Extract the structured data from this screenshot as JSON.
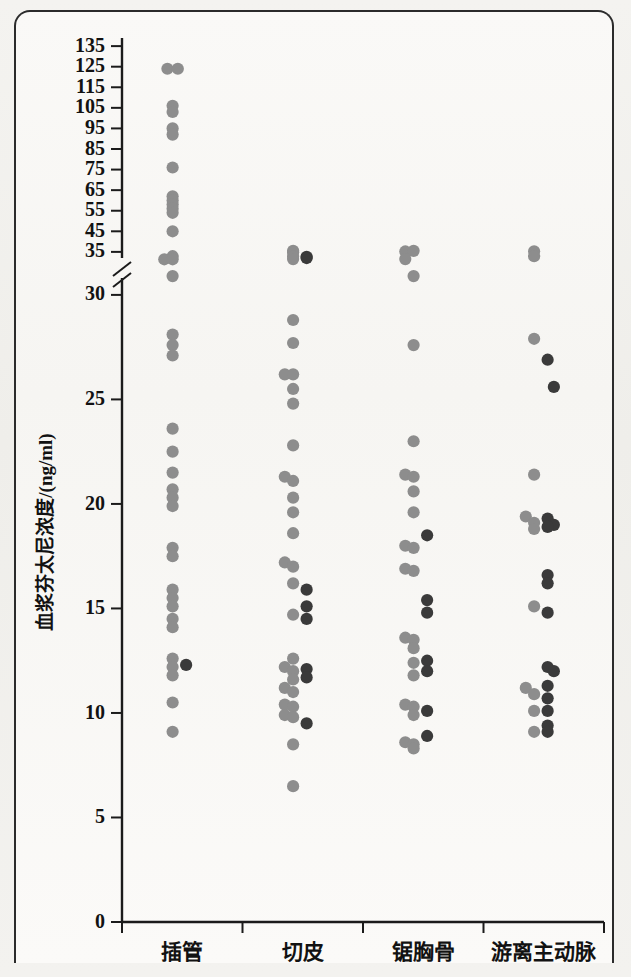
{
  "figure": {
    "background_color": "#f2f1ee",
    "frame_color": "#2b2b2b"
  },
  "chart_data": {
    "type": "scatter",
    "title": "",
    "xlabel": "",
    "ylabel": "血浆芬太尼浓度/(ng/ml)",
    "categories": [
      "插管",
      "切皮",
      "锯胸骨",
      "游离主动脉"
    ],
    "y_axis": {
      "broken": true,
      "lower_ticks": [
        0,
        5,
        10,
        15,
        20,
        25,
        30
      ],
      "upper_ticks": [
        35,
        45,
        55,
        65,
        75,
        85,
        95,
        105,
        115,
        125,
        135
      ],
      "lower_range": [
        0,
        31
      ],
      "upper_range": [
        33,
        137
      ],
      "break_symbol": "//",
      "grid": false
    },
    "legend": {
      "visible": false,
      "position": "none"
    },
    "series": [
      {
        "name": "series-gray",
        "color": "#8d8d8d",
        "points": [
          {
            "category": "插管",
            "y": 124,
            "jitter": -1
          },
          {
            "category": "插管",
            "y": 124,
            "jitter": 1
          },
          {
            "category": "插管",
            "y": 106,
            "jitter": 0
          },
          {
            "category": "插管",
            "y": 103,
            "jitter": 0
          },
          {
            "category": "插管",
            "y": 95,
            "jitter": 0
          },
          {
            "category": "插管",
            "y": 92,
            "jitter": 0
          },
          {
            "category": "插管",
            "y": 76,
            "jitter": 0
          },
          {
            "category": "插管",
            "y": 62,
            "jitter": 0
          },
          {
            "category": "插管",
            "y": 60,
            "jitter": 0
          },
          {
            "category": "插管",
            "y": 58,
            "jitter": 0
          },
          {
            "category": "插管",
            "y": 56,
            "jitter": 0
          },
          {
            "category": "插管",
            "y": 54,
            "jitter": 0
          },
          {
            "category": "插管",
            "y": 45,
            "jitter": 0
          },
          {
            "category": "插管",
            "y": 32.9,
            "jitter": 0
          },
          {
            "category": "插管",
            "y": 31.4,
            "jitter": -1.6
          },
          {
            "category": "插管",
            "y": 31.4,
            "jitter": 0
          },
          {
            "category": "插管",
            "y": 30.9,
            "jitter": 0
          },
          {
            "category": "插管",
            "y": 28.1,
            "jitter": 0
          },
          {
            "category": "插管",
            "y": 27.6,
            "jitter": 0
          },
          {
            "category": "插管",
            "y": 27.1,
            "jitter": 0
          },
          {
            "category": "插管",
            "y": 23.6,
            "jitter": 0
          },
          {
            "category": "插管",
            "y": 22.5,
            "jitter": 0
          },
          {
            "category": "插管",
            "y": 21.5,
            "jitter": 0
          },
          {
            "category": "插管",
            "y": 20.7,
            "jitter": 0
          },
          {
            "category": "插管",
            "y": 20.3,
            "jitter": 0
          },
          {
            "category": "插管",
            "y": 19.9,
            "jitter": 0
          },
          {
            "category": "插管",
            "y": 17.9,
            "jitter": 0
          },
          {
            "category": "插管",
            "y": 17.5,
            "jitter": 0
          },
          {
            "category": "插管",
            "y": 15.9,
            "jitter": 0
          },
          {
            "category": "插管",
            "y": 15.5,
            "jitter": 0
          },
          {
            "category": "插管",
            "y": 15.1,
            "jitter": 0
          },
          {
            "category": "插管",
            "y": 14.5,
            "jitter": 0
          },
          {
            "category": "插管",
            "y": 14.1,
            "jitter": 0
          },
          {
            "category": "插管",
            "y": 12.6,
            "jitter": 0
          },
          {
            "category": "插管",
            "y": 12.2,
            "jitter": 0
          },
          {
            "category": "插管",
            "y": 11.8,
            "jitter": 0
          },
          {
            "category": "插管",
            "y": 10.5,
            "jitter": 0
          },
          {
            "category": "插管",
            "y": 9.1,
            "jitter": 0
          },
          {
            "category": "切皮",
            "y": 35.5,
            "jitter": 0
          },
          {
            "category": "切皮",
            "y": 34.8,
            "jitter": 0
          },
          {
            "category": "切皮",
            "y": 32.8,
            "jitter": 0
          },
          {
            "category": "切皮",
            "y": 31.5,
            "jitter": 0
          },
          {
            "category": "切皮",
            "y": 28.8,
            "jitter": 0
          },
          {
            "category": "切皮",
            "y": 27.7,
            "jitter": 0
          },
          {
            "category": "切皮",
            "y": 26.2,
            "jitter": -1.6
          },
          {
            "category": "切皮",
            "y": 26.2,
            "jitter": 0
          },
          {
            "category": "切皮",
            "y": 25.5,
            "jitter": 0
          },
          {
            "category": "切皮",
            "y": 24.8,
            "jitter": 0
          },
          {
            "category": "切皮",
            "y": 22.8,
            "jitter": 0
          },
          {
            "category": "切皮",
            "y": 21.3,
            "jitter": -1.6
          },
          {
            "category": "切皮",
            "y": 21.1,
            "jitter": 0
          },
          {
            "category": "切皮",
            "y": 20.3,
            "jitter": 0
          },
          {
            "category": "切皮",
            "y": 19.6,
            "jitter": 0
          },
          {
            "category": "切皮",
            "y": 18.6,
            "jitter": 0
          },
          {
            "category": "切皮",
            "y": 17.2,
            "jitter": -1.6
          },
          {
            "category": "切皮",
            "y": 17.0,
            "jitter": 0
          },
          {
            "category": "切皮",
            "y": 16.2,
            "jitter": 0
          },
          {
            "category": "切皮",
            "y": 14.7,
            "jitter": 0
          },
          {
            "category": "切皮",
            "y": 12.6,
            "jitter": 0
          },
          {
            "category": "切皮",
            "y": 12.2,
            "jitter": -1.6
          },
          {
            "category": "切皮",
            "y": 12.0,
            "jitter": 0
          },
          {
            "category": "切皮",
            "y": 11.6,
            "jitter": 0
          },
          {
            "category": "切皮",
            "y": 11.2,
            "jitter": -1.6
          },
          {
            "category": "切皮",
            "y": 11.0,
            "jitter": 0
          },
          {
            "category": "切皮",
            "y": 10.4,
            "jitter": -1.6
          },
          {
            "category": "切皮",
            "y": 10.3,
            "jitter": 0
          },
          {
            "category": "切皮",
            "y": 9.9,
            "jitter": -1.6
          },
          {
            "category": "切皮",
            "y": 9.8,
            "jitter": 0
          },
          {
            "category": "切皮",
            "y": 8.5,
            "jitter": 0
          },
          {
            "category": "切皮",
            "y": 6.5,
            "jitter": 0
          },
          {
            "category": "锯胸骨",
            "y": 35.2,
            "jitter": -1.6
          },
          {
            "category": "锯胸骨",
            "y": 35.5,
            "jitter": 0
          },
          {
            "category": "锯胸骨",
            "y": 31.5,
            "jitter": -1.6
          },
          {
            "category": "锯胸骨",
            "y": 30.9,
            "jitter": 0
          },
          {
            "category": "锯胸骨",
            "y": 27.6,
            "jitter": 0
          },
          {
            "category": "锯胸骨",
            "y": 23.0,
            "jitter": 0
          },
          {
            "category": "锯胸骨",
            "y": 21.4,
            "jitter": -1.6
          },
          {
            "category": "锯胸骨",
            "y": 21.3,
            "jitter": 0
          },
          {
            "category": "锯胸骨",
            "y": 20.6,
            "jitter": 0
          },
          {
            "category": "锯胸骨",
            "y": 19.6,
            "jitter": 0
          },
          {
            "category": "锯胸骨",
            "y": 18.0,
            "jitter": -1.6
          },
          {
            "category": "锯胸骨",
            "y": 17.9,
            "jitter": 0
          },
          {
            "category": "锯胸骨",
            "y": 16.9,
            "jitter": -1.6
          },
          {
            "category": "锯胸骨",
            "y": 16.8,
            "jitter": 0
          },
          {
            "category": "锯胸骨",
            "y": 13.6,
            "jitter": -1.6
          },
          {
            "category": "锯胸骨",
            "y": 13.5,
            "jitter": 0
          },
          {
            "category": "锯胸骨",
            "y": 13.1,
            "jitter": 0
          },
          {
            "category": "锯胸骨",
            "y": 12.4,
            "jitter": 0
          },
          {
            "category": "锯胸骨",
            "y": 11.8,
            "jitter": 0
          },
          {
            "category": "锯胸骨",
            "y": 10.4,
            "jitter": -1.6
          },
          {
            "category": "锯胸骨",
            "y": 10.3,
            "jitter": 0
          },
          {
            "category": "锯胸骨",
            "y": 9.9,
            "jitter": 0
          },
          {
            "category": "锯胸骨",
            "y": 8.6,
            "jitter": -1.6
          },
          {
            "category": "锯胸骨",
            "y": 8.5,
            "jitter": 0
          },
          {
            "category": "锯胸骨",
            "y": 8.3,
            "jitter": 0
          },
          {
            "category": "游离主动脉",
            "y": 35.3,
            "jitter": 0
          },
          {
            "category": "游离主动脉",
            "y": 32.9,
            "jitter": 0
          },
          {
            "category": "游离主动脉",
            "y": 27.9,
            "jitter": 0
          },
          {
            "category": "游离主动脉",
            "y": 21.4,
            "jitter": 0
          },
          {
            "category": "游离主动脉",
            "y": 19.4,
            "jitter": -1.6
          },
          {
            "category": "游离主动脉",
            "y": 19.1,
            "jitter": 0
          },
          {
            "category": "游离主动脉",
            "y": 18.8,
            "jitter": 0
          },
          {
            "category": "游离主动脉",
            "y": 15.1,
            "jitter": 0
          },
          {
            "category": "游离主动脉",
            "y": 11.2,
            "jitter": -1.6
          },
          {
            "category": "游离主动脉",
            "y": 10.9,
            "jitter": 0
          },
          {
            "category": "游离主动脉",
            "y": 10.1,
            "jitter": 0
          },
          {
            "category": "游离主动脉",
            "y": 9.1,
            "jitter": 0
          }
        ]
      },
      {
        "name": "series-dark",
        "color": "#3a3a3a",
        "points": [
          {
            "category": "插管",
            "y": 12.3,
            "jitter": 2.6
          },
          {
            "category": "切皮",
            "y": 32.6,
            "jitter": 2.6
          },
          {
            "category": "切皮",
            "y": 32.0,
            "jitter": 2.6
          },
          {
            "category": "切皮",
            "y": 15.9,
            "jitter": 2.6
          },
          {
            "category": "切皮",
            "y": 15.1,
            "jitter": 2.6
          },
          {
            "category": "切皮",
            "y": 14.5,
            "jitter": 2.6
          },
          {
            "category": "切皮",
            "y": 12.1,
            "jitter": 2.6
          },
          {
            "category": "切皮",
            "y": 11.7,
            "jitter": 2.6
          },
          {
            "category": "切皮",
            "y": 9.5,
            "jitter": 2.6
          },
          {
            "category": "锯胸骨",
            "y": 18.5,
            "jitter": 2.6
          },
          {
            "category": "锯胸骨",
            "y": 15.4,
            "jitter": 2.6
          },
          {
            "category": "锯胸骨",
            "y": 14.8,
            "jitter": 2.6
          },
          {
            "category": "锯胸骨",
            "y": 12.5,
            "jitter": 2.6
          },
          {
            "category": "锯胸骨",
            "y": 12.0,
            "jitter": 2.6
          },
          {
            "category": "锯胸骨",
            "y": 10.1,
            "jitter": 2.6
          },
          {
            "category": "锯胸骨",
            "y": 8.9,
            "jitter": 2.6
          },
          {
            "category": "游离主动脉",
            "y": 26.9,
            "jitter": 2.6
          },
          {
            "category": "游离主动脉",
            "y": 25.6,
            "jitter": 3.8
          },
          {
            "category": "游离主动脉",
            "y": 19.3,
            "jitter": 2.6
          },
          {
            "category": "游离主动脉",
            "y": 19.0,
            "jitter": 3.8
          },
          {
            "category": "游离主动脉",
            "y": 18.9,
            "jitter": 2.6
          },
          {
            "category": "游离主动脉",
            "y": 16.6,
            "jitter": 2.6
          },
          {
            "category": "游离主动脉",
            "y": 16.2,
            "jitter": 2.6
          },
          {
            "category": "游离主动脉",
            "y": 14.8,
            "jitter": 2.6
          },
          {
            "category": "游离主动脉",
            "y": 12.2,
            "jitter": 2.6
          },
          {
            "category": "游离主动脉",
            "y": 12.0,
            "jitter": 3.8
          },
          {
            "category": "游离主动脉",
            "y": 11.3,
            "jitter": 2.6
          },
          {
            "category": "游离主动脉",
            "y": 10.7,
            "jitter": 2.6
          },
          {
            "category": "游离主动脉",
            "y": 10.1,
            "jitter": 2.6
          },
          {
            "category": "游离主动脉",
            "y": 9.4,
            "jitter": 2.6
          },
          {
            "category": "游离主动脉",
            "y": 9.1,
            "jitter": 2.6
          }
        ]
      }
    ]
  }
}
